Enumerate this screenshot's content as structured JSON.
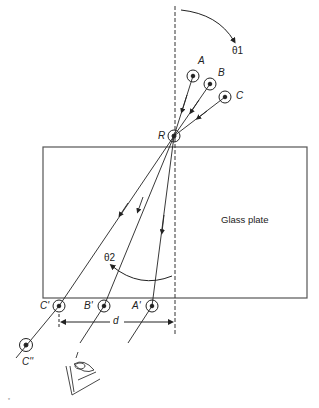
{
  "figure": {
    "type": "refraction-through-glass-plate",
    "plate_label": "Glass plate",
    "incident_pins": [
      {
        "label": "A",
        "x": 193,
        "y": 76
      },
      {
        "label": "B",
        "x": 210,
        "y": 84
      },
      {
        "label": "C",
        "x": 225,
        "y": 97
      }
    ],
    "refraction_point": {
      "label": "R",
      "x": 174,
      "y": 136
    },
    "exit_pins": [
      {
        "label": "A'",
        "x": 152,
        "y": 306
      },
      {
        "label": "B'",
        "x": 104,
        "y": 306
      },
      {
        "label": "C'",
        "x": 59,
        "y": 306
      }
    ],
    "extra_pin": {
      "label": "C''",
      "x": 26,
      "y": 345
    },
    "angles": {
      "incident": "θ1",
      "refracted": "θ2"
    },
    "displacement_label": "d",
    "colors": {
      "line": "#222222",
      "background": "#ffffff"
    }
  }
}
